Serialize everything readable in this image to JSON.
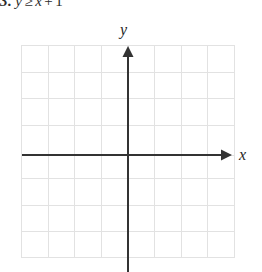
{
  "problem": {
    "number": "3.",
    "lhs": "y",
    "operator": "≥",
    "rhs_variable": "x",
    "plus": "+",
    "constant": "1",
    "full_text": "3. y ≥ x + 1"
  },
  "graph": {
    "y_axis_label": "y",
    "x_axis_label": "x",
    "grid": {
      "columns": 8,
      "rows": 8,
      "cell_size_px": 26.6,
      "left_px": 21,
      "top_px": 45,
      "right_px": 234,
      "bottom_px": 258,
      "line_color": "#e2e2e2",
      "show_grid": true
    },
    "axes": {
      "origin_x_px": 128,
      "origin_y_px": 155,
      "axis_color": "#333333",
      "axis_width_px": 2,
      "x_axis_start_px": 22,
      "x_axis_end_px": 231,
      "y_axis_start_px": 47,
      "y_axis_end_px": 270,
      "x_arrow": "right",
      "y_arrow": "up"
    },
    "plotted_curve": false,
    "shaded_region": false
  },
  "colors": {
    "background": "#ffffff",
    "grid_line": "#e2e2e2",
    "axis": "#333333",
    "text": "#1f1f1f"
  }
}
